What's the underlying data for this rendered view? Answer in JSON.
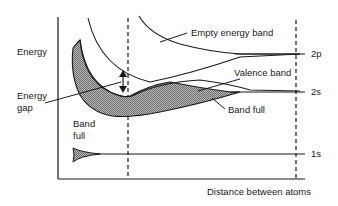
{
  "diagram": {
    "y_axis_label": "Energy",
    "x_axis_label": "Distance between atoms",
    "labels": {
      "energy_gap_line1": "Energy",
      "energy_gap_line2": "gap",
      "empty_band": "Empty energy band",
      "valence_band": "Valence band",
      "band_full_upper": "Band full",
      "band_full_lower_line1": "Band",
      "band_full_lower_line2": "full"
    },
    "levels": {
      "level_2p": "2p",
      "level_2s": "2s",
      "level_1s": "1s"
    },
    "colors": {
      "line": "#1a1a1a",
      "shaded_band": "#9a9a9a",
      "background": "#ffffff"
    }
  }
}
